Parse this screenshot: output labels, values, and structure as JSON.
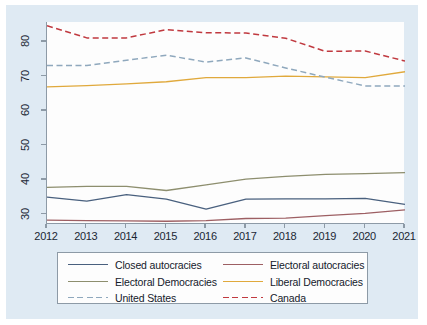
{
  "figure": {
    "background_color": "#dfeaf3",
    "panel_color": "#fdfdfd",
    "axis_color": "#8d9aa6"
  },
  "chart_data": {
    "type": "line",
    "title": "",
    "subtitle": "",
    "xlabel": "",
    "ylabel": "",
    "x": [
      2012,
      2013,
      2014,
      2015,
      2016,
      2017,
      2018,
      2019,
      2020,
      2021
    ],
    "categories": [
      "2012",
      "2013",
      "2014",
      "2015",
      "2016",
      "2017",
      "2018",
      "2019",
      "2020",
      "2021"
    ],
    "xlim": [
      2012,
      2021
    ],
    "ylim": [
      27,
      85.5
    ],
    "yticks": [
      30,
      40,
      50,
      60,
      70,
      80
    ],
    "ytick_labels": [
      "30",
      "40",
      "50",
      "60",
      "70",
      "80"
    ],
    "xtick_labels": [
      "2012",
      "2013",
      "2014",
      "2015",
      "2016",
      "2017",
      "2018",
      "2019",
      "2020",
      "2021"
    ],
    "grid": false,
    "legend_position": "bottom",
    "series": [
      {
        "name": "Closed autocracies",
        "color": "#49607e",
        "style": "solid",
        "values": [
          34.8,
          33.6,
          35.5,
          34.2,
          31.3,
          34.2,
          34.3,
          34.3,
          34.4,
          32.7
        ]
      },
      {
        "name": "Electoral autocracies",
        "color": "#9d5f63",
        "style": "solid",
        "values": [
          28.1,
          28.0,
          27.9,
          27.8,
          28.0,
          28.6,
          28.7,
          29.4,
          30.1,
          31.1
        ]
      },
      {
        "name": "Electoral Democracies",
        "color": "#8d8e6e",
        "style": "solid",
        "values": [
          37.6,
          37.9,
          37.9,
          36.7,
          38.3,
          40.0,
          40.8,
          41.4,
          41.6,
          41.9
        ]
      },
      {
        "name": "Liberal Democracies",
        "color": "#e0a93c",
        "style": "solid",
        "values": [
          66.7,
          67.1,
          67.6,
          68.2,
          69.4,
          69.4,
          69.8,
          69.6,
          69.4,
          71.1
        ]
      },
      {
        "name": "United States",
        "color": "#8fa8bd",
        "style": "dashed",
        "values": [
          72.9,
          72.9,
          74.4,
          75.9,
          73.9,
          75.1,
          72.2,
          69.5,
          67.0,
          67.0
        ]
      },
      {
        "name": "Canada",
        "color": "#c0393f",
        "style": "dashed",
        "values": [
          84.4,
          80.9,
          80.9,
          83.3,
          82.4,
          82.3,
          80.8,
          77.0,
          77.1,
          74.2
        ]
      }
    ]
  },
  "legend": {
    "entries": [
      {
        "label": "Closed autocracies",
        "color": "#49607e",
        "style": "solid",
        "col": 0,
        "row": 0
      },
      {
        "label": "Electoral autocracies",
        "color": "#9d5f63",
        "style": "solid",
        "col": 1,
        "row": 0
      },
      {
        "label": "Electoral Democracies",
        "color": "#8d8e6e",
        "style": "solid",
        "col": 0,
        "row": 1
      },
      {
        "label": "Liberal Democracies",
        "color": "#e0a93c",
        "style": "solid",
        "col": 1,
        "row": 1
      },
      {
        "label": "United States",
        "color": "#8fa8bd",
        "style": "dashed",
        "col": 0,
        "row": 2
      },
      {
        "label": "Canada",
        "color": "#c0393f",
        "style": "dashed",
        "col": 1,
        "row": 2
      }
    ]
  }
}
